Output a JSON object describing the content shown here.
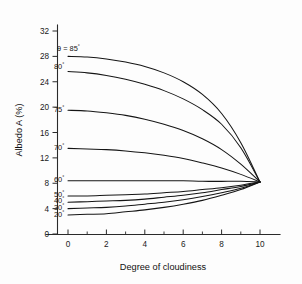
{
  "chart_data": {
    "type": "line",
    "title": "",
    "xlabel": "Degree of cloudiness",
    "ylabel": "Albedo A (%)",
    "xlim": [
      0,
      10
    ],
    "ylim": [
      0,
      32
    ],
    "xticks": [
      0,
      2,
      4,
      6,
      8,
      10
    ],
    "yticks": [
      0,
      4,
      8,
      12,
      16,
      20,
      24,
      28,
      32
    ],
    "xtick_labels": [
      "0",
      "2",
      "4",
      "6",
      "8",
      "10"
    ],
    "ytick_labels": [
      "0",
      "4",
      "8",
      "12",
      "16",
      "20",
      "24",
      "28",
      "32"
    ],
    "x_minor_ticks": [
      1,
      3,
      5,
      7,
      9
    ],
    "grid": false,
    "legend_position": "inline-left-of-curves",
    "x": [
      0,
      1,
      2,
      3,
      4,
      5,
      6,
      7,
      8,
      9,
      10
    ],
    "series": [
      {
        "name": "85",
        "label": "θ = 85°",
        "label_prefix": "θ = ",
        "label_value": "85",
        "label_degree": "°",
        "values": [
          28.0,
          27.9,
          27.6,
          27.1,
          26.4,
          25.4,
          24.0,
          22.0,
          19.0,
          14.4,
          8.2
        ]
      },
      {
        "name": "80",
        "label": "80°",
        "label_prefix": "",
        "label_value": "80",
        "label_degree": "°",
        "values": [
          25.6,
          25.4,
          25.0,
          24.4,
          23.6,
          22.6,
          21.3,
          19.6,
          17.3,
          13.6,
          8.2
        ]
      },
      {
        "name": "75",
        "label": "75°",
        "label_prefix": "",
        "label_value": "75",
        "label_degree": "°",
        "values": [
          19.5,
          19.4,
          19.1,
          18.7,
          18.1,
          17.3,
          16.3,
          15.0,
          13.3,
          11.0,
          8.2
        ]
      },
      {
        "name": "70",
        "label": "70°",
        "label_prefix": "",
        "label_value": "70",
        "label_degree": "°",
        "values": [
          13.5,
          13.4,
          13.3,
          13.1,
          12.8,
          12.4,
          11.9,
          11.2,
          10.4,
          9.4,
          8.2
        ]
      },
      {
        "name": "60",
        "label": "60°",
        "label_prefix": "",
        "label_value": "60",
        "label_degree": "°",
        "values": [
          8.4,
          8.4,
          8.4,
          8.4,
          8.4,
          8.4,
          8.4,
          8.3,
          8.3,
          8.3,
          8.2
        ]
      },
      {
        "name": "50",
        "label": "50°",
        "label_prefix": "",
        "label_value": "50",
        "label_degree": "°",
        "values": [
          6.0,
          6.0,
          6.1,
          6.2,
          6.3,
          6.5,
          6.7,
          7.0,
          7.3,
          7.7,
          8.2
        ]
      },
      {
        "name": "40",
        "label": "40°",
        "label_prefix": "",
        "label_value": "40",
        "label_degree": "°",
        "values": [
          5.0,
          5.1,
          5.2,
          5.3,
          5.5,
          5.8,
          6.1,
          6.5,
          7.0,
          7.5,
          8.2
        ]
      },
      {
        "name": "30",
        "label": "30°",
        "label_prefix": "",
        "label_value": "30",
        "label_degree": "°",
        "values": [
          4.0,
          4.1,
          4.2,
          4.4,
          4.7,
          5.0,
          5.4,
          5.9,
          6.5,
          7.2,
          8.2
        ]
      },
      {
        "name": "20",
        "label": "20°",
        "label_prefix": "",
        "label_value": "20",
        "label_degree": "°",
        "values": [
          3.0,
          3.1,
          3.2,
          3.5,
          3.8,
          4.2,
          4.7,
          5.3,
          6.1,
          7.0,
          8.2
        ]
      }
    ],
    "convergence_point": {
      "x": 10,
      "y": 8.2
    },
    "annotations": []
  },
  "labels": {
    "theta_symbol": "θ",
    "degree_symbol": "°"
  }
}
